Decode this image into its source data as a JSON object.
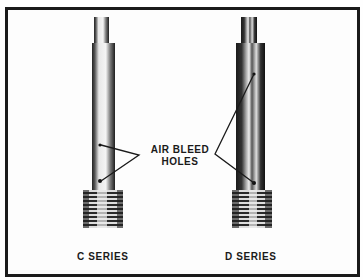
{
  "figure": {
    "callout": {
      "line1": "AIR BLEED",
      "line2": "HOLES"
    },
    "parts": [
      {
        "label": "C SERIES"
      },
      {
        "label": "D SERIES"
      }
    ],
    "colors": {
      "ink": "#1a1a1a",
      "paper": "#fdfdfd"
    }
  }
}
